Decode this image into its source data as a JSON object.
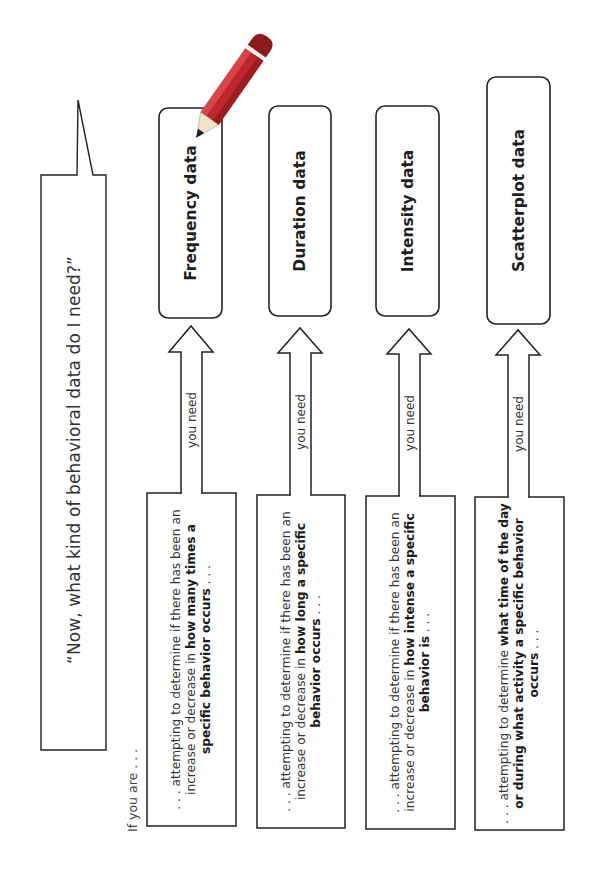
{
  "bubble": {
    "quote": "“Now, what kind of behavioral data do I need?”"
  },
  "intro": "If you are . . .",
  "arrow_label": "you need",
  "colors": {
    "stroke": "#222222",
    "pencil_body": "#c0272d",
    "pencil_cap": "#8f1a1e",
    "pencil_band": "#f2f2f2",
    "pencil_wood": "#f1e3c8",
    "pencil_lead": "#222222"
  },
  "columns": [
    {
      "label": "Frequency data",
      "condition": {
        "prefix": ". . . attempting to determine if there has been an increase or decrease in ",
        "bold": "how many times a specific behavior occurs",
        "suffix": " . . ."
      }
    },
    {
      "label": "Duration data",
      "condition": {
        "prefix": ". . . attempting to determine if there has been an increase or decrease in ",
        "bold": "how long a specific behavior occurs",
        "suffix": " . . ."
      }
    },
    {
      "label": "Intensity data",
      "condition": {
        "prefix": ". . . attempting to determine if there has been an increase or decrease in ",
        "bold": "how intense a specific behavior is",
        "suffix": " . . ."
      }
    },
    {
      "label": "Scatterplot data",
      "condition": {
        "prefix": ". . . attempting to determine ",
        "bold": "what time of the day or during what activity a specific behavior occurs",
        "suffix": " . . ."
      }
    }
  ]
}
